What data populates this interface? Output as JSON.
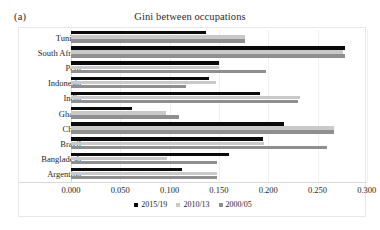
{
  "panel_label": "(a)",
  "title": "Gini between occupations",
  "axis": {
    "ticks": [
      "0.000",
      "0.050",
      "0.100",
      "0.150",
      "0.200",
      "0.250",
      "0.300"
    ],
    "tick_values": [
      0.0,
      0.05,
      0.1,
      0.15,
      0.2,
      0.25,
      0.3
    ]
  },
  "legend": {
    "items": [
      {
        "label": "2015/19",
        "color": "#0a0a0a"
      },
      {
        "label": "2010/13",
        "color": "#c9c9c9"
      },
      {
        "label": "2000/05",
        "color": "#8f8f8f"
      }
    ]
  },
  "chart_data": {
    "type": "bar",
    "orientation": "horizontal",
    "title": "Gini between occupations",
    "xlabel": "",
    "ylabel": "",
    "xlim": [
      0.0,
      0.3
    ],
    "grid": true,
    "legend_position": "bottom",
    "categories": [
      "Tunisia",
      "South Africa",
      "Peru",
      "Indonesia",
      "India",
      "Ghana",
      "Chile",
      "Brazil",
      "Bangladesh",
      "Argentina"
    ],
    "series": [
      {
        "name": "2015/19",
        "color": "#0a0a0a",
        "values": [
          0.137,
          0.278,
          0.15,
          0.14,
          0.192,
          0.062,
          0.216,
          0.195,
          0.16,
          0.113
        ]
      },
      {
        "name": "2010/13",
        "color": "#c9c9c9",
        "values": [
          0.176,
          0.276,
          0.15,
          0.147,
          0.232,
          0.096,
          0.267,
          0.196,
          0.097,
          0.148
        ]
      },
      {
        "name": "2000/05",
        "color": "#8f8f8f",
        "values": [
          0.176,
          0.278,
          0.198,
          0.117,
          0.23,
          0.11,
          0.267,
          0.26,
          0.148,
          0.148
        ]
      }
    ]
  }
}
